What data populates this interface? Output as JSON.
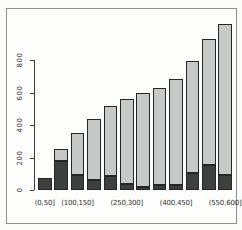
{
  "chart_data": {
    "type": "bar",
    "stacked": true,
    "title": "",
    "xlabel": "",
    "ylabel": "",
    "bar_count": 12,
    "y_ticks": [
      0,
      200,
      400,
      600,
      800
    ],
    "ylim": [
      0,
      1040
    ],
    "grid": false,
    "legend": "none",
    "x_tick_labels": [
      {
        "text": "(0,50]",
        "bar_index": 0
      },
      {
        "text": "(100,150]",
        "bar_index": 2
      },
      {
        "text": "(250,300]",
        "bar_index": 5
      },
      {
        "text": "(400,450]",
        "bar_index": 8
      },
      {
        "text": "(550,600]",
        "bar_index": 11
      }
    ],
    "series": [
      {
        "name": "bottom-dark-segment",
        "color": "#3e4040",
        "values": [
          75,
          180,
          95,
          60,
          85,
          35,
          20,
          30,
          30,
          105,
          155,
          95
        ]
      },
      {
        "name": "top-light-segment",
        "color": "#c7c9c8",
        "values": [
          0,
          75,
          255,
          380,
          430,
          525,
          575,
          595,
          655,
          690,
          775,
          925
        ]
      }
    ],
    "totals": [
      75,
      255,
      350,
      440,
      515,
      560,
      595,
      625,
      685,
      795,
      930,
      1020
    ]
  },
  "colors": {
    "axis": "#3a3a3a",
    "frame_border": "#8f9193",
    "background": "#fdfdfc"
  }
}
